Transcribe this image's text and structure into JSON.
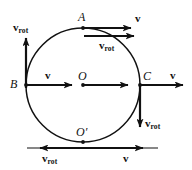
{
  "figure": {
    "background_color": "#ffffff",
    "stroke_color": "#111111",
    "width": 192,
    "height": 170,
    "circle": {
      "cx": 83,
      "cy": 85,
      "r": 57
    }
  },
  "points": [
    {
      "id": "A",
      "label": "A",
      "x": 83,
      "y": 28,
      "desc": "top-of-circle point"
    },
    {
      "id": "B",
      "label": "B",
      "x": 26,
      "y": 85,
      "desc": "left-of-circle point"
    },
    {
      "id": "C",
      "label": "C",
      "x": 140,
      "y": 85,
      "desc": "right-of-circle point"
    },
    {
      "id": "O",
      "label": "O",
      "x": 83,
      "y": 85,
      "desc": "center point"
    },
    {
      "id": "Oprime",
      "label": "O′",
      "x": 83,
      "y": 142,
      "desc": "bottom contact point"
    }
  ],
  "labels": {
    "A": "A",
    "B": "B",
    "C": "C",
    "O": "O",
    "O_prime": "O′",
    "v": "v",
    "v_rot_base": "v",
    "v_rot_sub": "rot"
  },
  "vectors": [
    {
      "id": "v-at-A",
      "label_base": "v",
      "label_sub": "",
      "at_point": "A",
      "direction": "right"
    },
    {
      "id": "vrot-at-A",
      "label_base": "v",
      "label_sub": "rot",
      "at_point": "A",
      "direction": "right"
    },
    {
      "id": "vrot-at-B",
      "label_base": "v",
      "label_sub": "rot",
      "at_point": "B",
      "direction": "up"
    },
    {
      "id": "v-at-B",
      "label_base": "v",
      "label_sub": "",
      "at_point": "B",
      "direction": "right"
    },
    {
      "id": "v-at-O",
      "label_base": "",
      "label_sub": "",
      "at_point": "O",
      "direction": "right"
    },
    {
      "id": "v-at-C",
      "label_base": "v",
      "label_sub": "",
      "at_point": "C",
      "direction": "right"
    },
    {
      "id": "vrot-at-C",
      "label_base": "v",
      "label_sub": "rot",
      "at_point": "C",
      "direction": "down"
    },
    {
      "id": "vrot-at-Oprime",
      "label_base": "v",
      "label_sub": "rot",
      "at_point": "Oprime",
      "direction": "left"
    },
    {
      "id": "v-at-Oprime",
      "label_base": "v",
      "label_sub": "",
      "at_point": "Oprime",
      "direction": "right"
    }
  ]
}
